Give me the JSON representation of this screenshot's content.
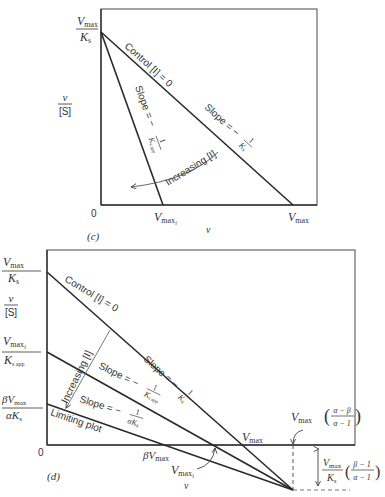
{
  "panel_c": {
    "caption": "(c)",
    "y_axis_label_num": "v",
    "y_axis_label_den": "[S]",
    "x_axis_label": "v",
    "origin": "0",
    "y_intercept_num": "V",
    "y_intercept_num_sub": "max",
    "y_intercept_den": "K",
    "y_intercept_den_sub": "s",
    "x_intercept_inhibited": "V",
    "x_intercept_inhibited_sub": "max",
    "x_intercept_inhibited_subsub": "i",
    "x_intercept_control": "V",
    "x_intercept_control_sub": "max",
    "control_label": "Control [I] = 0",
    "slope_control_prefix": "Slope = −",
    "slope_control_num": "1",
    "slope_control_den": "K",
    "slope_control_den_sub": "s",
    "slope_inhibited_prefix": "Slope = −",
    "slope_inhibited_num": "1",
    "slope_inhibited_den": "K",
    "slope_inhibited_den_sub": "s app",
    "increasing_label": "Increasing [I]"
  },
  "panel_d": {
    "caption": "(d)",
    "y_axis_label_num": "v",
    "y_axis_label_den": "[S]",
    "x_axis_label": "v",
    "origin": "0",
    "y_intercept_control_num": "V",
    "y_intercept_control_num_sub": "max",
    "y_intercept_control_den": "K",
    "y_intercept_control_den_sub": "s",
    "y_intercept_inhibited_num": "V",
    "y_intercept_inhibited_num_sub": "max",
    "y_intercept_inhibited_num_subsub": "i",
    "y_intercept_inhibited_den": "K",
    "y_intercept_inhibited_den_sub": "s app",
    "y_intercept_limiting_num": "βV",
    "y_intercept_limiting_num_sub": "max",
    "y_intercept_limiting_den": "αK",
    "y_intercept_limiting_den_sub": "s",
    "control_label": "Control [I] = 0",
    "increasing_label": "Increasing [I]",
    "limiting_label": "Limiting plot",
    "slope_control_prefix": "Slope = −",
    "slope_control_num": "1",
    "slope_control_den": "K",
    "slope_control_den_sub": "s",
    "slope_inhibited_prefix": "Slope = −",
    "slope_inhibited_num": "1",
    "slope_inhibited_den": "K",
    "slope_inhibited_den_sub": "s app",
    "slope_limiting_prefix": "Slope = −",
    "slope_limiting_num": "1",
    "slope_limiting_den": "αK",
    "slope_limiting_den_sub": "s",
    "x_intercept_control": "V",
    "x_intercept_control_sub": "max",
    "x_intercept_limiting": "βV",
    "x_intercept_limiting_sub": "max",
    "x_intercept_inhibited": "V",
    "x_intercept_inhibited_sub": "max",
    "x_intercept_inhibited_subsub": "i",
    "intersection_x_label": "V",
    "intersection_x_label_sub": "max",
    "intersection_x_frac_num": "α − β",
    "intersection_x_frac_den": "α − 1",
    "intersection_y_label_num": "V",
    "intersection_y_label_num_sub": "max",
    "intersection_y_label_den": "K",
    "intersection_y_label_den_sub": "s",
    "intersection_y_frac_num": "β − 1",
    "intersection_y_frac_den": "α − 1"
  },
  "colors": {
    "line": "#2a2a2a",
    "frame": "#555555",
    "thin": "#777777",
    "background": "#ffffff"
  }
}
